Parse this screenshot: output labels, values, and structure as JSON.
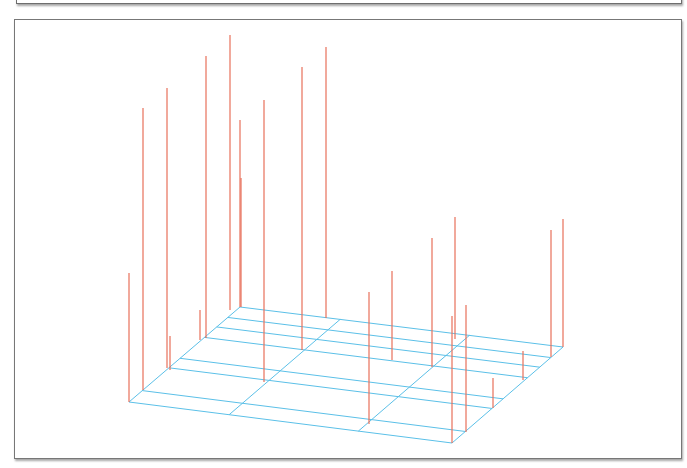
{
  "chart_data": {
    "type": "3d-stem",
    "title": "",
    "xlabel": "",
    "ylabel": "",
    "zlabel": "",
    "grid": true,
    "axes_visible": false,
    "colors": {
      "stem": "#e8705a",
      "grid": "#5bc0e8",
      "frame": "#777777",
      "background": "#ffffff"
    },
    "floor": {
      "front_left": [
        129,
        402
      ],
      "front_right": [
        452,
        443
      ],
      "back_left": [
        240,
        307
      ],
      "back_right": [
        563,
        347
      ],
      "inner_offset": [
        12,
        -11
      ]
    },
    "stems_px": [
      {
        "x": 129,
        "top": 273,
        "base": 402
      },
      {
        "x": 143,
        "top": 108,
        "base": 390
      },
      {
        "x": 167,
        "top": 88,
        "base": 368
      },
      {
        "x": 170,
        "top": 336,
        "base": 370
      },
      {
        "x": 200,
        "top": 310,
        "base": 340
      },
      {
        "x": 206,
        "top": 56,
        "base": 338
      },
      {
        "x": 230,
        "top": 35,
        "base": 310
      },
      {
        "x": 240,
        "top": 120,
        "base": 307
      },
      {
        "x": 241,
        "top": 178,
        "base": 307
      },
      {
        "x": 264,
        "top": 100,
        "base": 382
      },
      {
        "x": 302,
        "top": 67,
        "base": 350
      },
      {
        "x": 326,
        "top": 47,
        "base": 318
      },
      {
        "x": 369,
        "top": 292,
        "base": 424
      },
      {
        "x": 392,
        "top": 271,
        "base": 360
      },
      {
        "x": 432,
        "top": 238,
        "base": 367
      },
      {
        "x": 452,
        "top": 316,
        "base": 443
      },
      {
        "x": 455,
        "top": 217,
        "base": 339
      },
      {
        "x": 466,
        "top": 305,
        "base": 432
      },
      {
        "x": 493,
        "top": 378,
        "base": 408
      },
      {
        "x": 523,
        "top": 351,
        "base": 380
      },
      {
        "x": 551,
        "top": 230,
        "base": 357
      },
      {
        "x": 563,
        "top": 219,
        "base": 347
      }
    ]
  }
}
